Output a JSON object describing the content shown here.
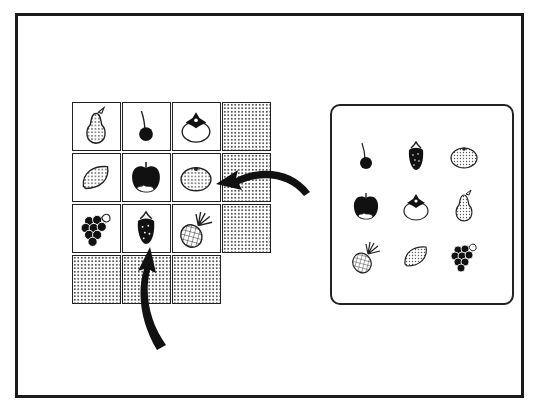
{
  "puzzle": {
    "description": "Fruit grid completion puzzle with answer options panel",
    "colors": {
      "line": "#222222",
      "fill": "#111111",
      "background": "#ffffff"
    },
    "grid": {
      "rows": 4,
      "cols": 4,
      "cells": [
        [
          {
            "fruit": "pear",
            "icon": "pear-icon"
          },
          {
            "fruit": "cherry",
            "icon": "cherry-icon"
          },
          {
            "fruit": "persimmon",
            "icon": "persimmon-icon"
          },
          {
            "fruit": "",
            "icon": "",
            "dotted": true
          }
        ],
        [
          {
            "fruit": "lemon",
            "icon": "lemon-icon"
          },
          {
            "fruit": "apple",
            "icon": "apple-icon"
          },
          {
            "fruit": "mandarin",
            "icon": "mandarin-icon"
          },
          {
            "fruit": "",
            "icon": "",
            "dotted": true
          }
        ],
        [
          {
            "fruit": "grapes",
            "icon": "grapes-icon"
          },
          {
            "fruit": "strawberry",
            "icon": "strawberry-icon"
          },
          {
            "fruit": "pineapple",
            "icon": "pineapple-icon"
          },
          {
            "fruit": "",
            "icon": "",
            "dotted": true
          }
        ],
        [
          {
            "fruit": "",
            "icon": "",
            "dotted": true
          },
          {
            "fruit": "",
            "icon": "",
            "dotted": true
          },
          {
            "fruit": "",
            "icon": "",
            "dotted": true
          },
          null
        ]
      ]
    },
    "options_panel": {
      "items": [
        {
          "fruit": "cherry",
          "icon": "cherry-icon"
        },
        {
          "fruit": "strawberry",
          "icon": "strawberry-icon"
        },
        {
          "fruit": "mandarin",
          "icon": "mandarin-icon"
        },
        {
          "fruit": "apple",
          "icon": "apple-icon"
        },
        {
          "fruit": "persimmon",
          "icon": "persimmon-icon"
        },
        {
          "fruit": "pear",
          "icon": "pear-icon"
        },
        {
          "fruit": "pineapple",
          "icon": "pineapple-icon"
        },
        {
          "fruit": "lemon",
          "icon": "lemon-icon"
        },
        {
          "fruit": "grapes",
          "icon": "grapes-icon"
        }
      ]
    },
    "arrows": [
      {
        "name": "arrow-to-mandarin",
        "from": "right",
        "target_cell": "row2-col3"
      },
      {
        "name": "arrow-to-strawberry",
        "from": "bottom",
        "target_cell": "row3-col2"
      }
    ]
  }
}
